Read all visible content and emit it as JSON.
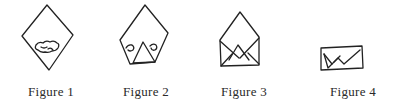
{
  "figures": [
    {
      "id": 1,
      "label": "Figure 1",
      "depiction": "diamond-paper-with-filling"
    },
    {
      "id": 2,
      "label": "Figure 2",
      "depiction": "bottom-corner-folded-up"
    },
    {
      "id": 3,
      "label": "Figure 3",
      "depiction": "side-corners-folded-in"
    },
    {
      "id": 4,
      "label": "Figure 4",
      "depiction": "top-folded-down-envelope"
    }
  ],
  "colors": {
    "line": "#222222",
    "text": "#2a2a2a",
    "background": "#ffffff"
  }
}
